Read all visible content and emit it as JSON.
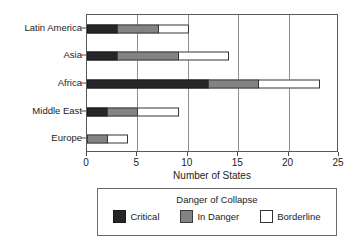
{
  "chart_data": {
    "type": "bar",
    "orientation": "horizontal",
    "stacked": true,
    "title": "",
    "xlabel": "Number of States",
    "ylabel": "",
    "xlim": [
      0,
      25
    ],
    "xticks": [
      0,
      5,
      10,
      15,
      20,
      25
    ],
    "grid": true,
    "grid_axis": "x",
    "legend_position": "bottom",
    "legend_title": "Danger of Collapse",
    "categories": [
      "Latin America",
      "Asia",
      "Africa",
      "Middle East",
      "Europe"
    ],
    "series": [
      {
        "name": "Critical",
        "color": "#262626",
        "values": [
          3,
          3,
          12,
          2,
          0
        ]
      },
      {
        "name": "In Danger",
        "color": "#838383",
        "values": [
          4,
          6,
          5,
          3,
          2
        ]
      },
      {
        "name": "Borderline",
        "color": "#ffffff",
        "values": [
          3,
          5,
          6,
          4,
          2
        ]
      }
    ],
    "totals": [
      10,
      14,
      23,
      9,
      4
    ]
  },
  "axis": {
    "x_title": "Number of States",
    "x_tick_labels": [
      "0",
      "5",
      "10",
      "15",
      "20",
      "25"
    ],
    "y_tick_labels": [
      "Latin America",
      "Asia",
      "Africa",
      "Middle East",
      "Europe"
    ]
  },
  "legend": {
    "title": "Danger of Collapse",
    "items": [
      {
        "label": "Critical",
        "swatch": "critical-swatch"
      },
      {
        "label": "In Danger",
        "swatch": "in-danger-swatch"
      },
      {
        "label": "Borderline",
        "swatch": "borderline-swatch"
      }
    ]
  }
}
